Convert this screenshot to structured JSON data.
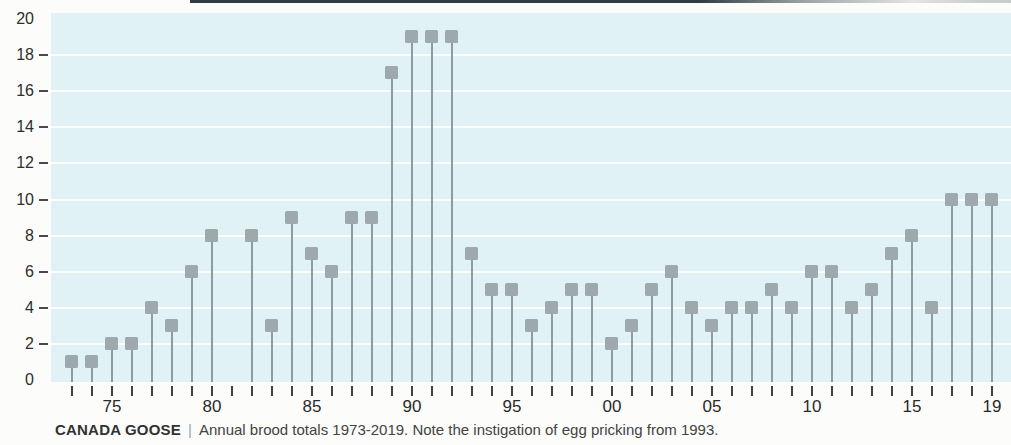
{
  "chart_data": {
    "type": "scatter",
    "variant": "lollipop-stem",
    "title": "CANADA GOOSE | Annual brood totals 1973-2019. Note the instigation of egg pricking from 1993.",
    "xlabel": "",
    "ylabel": "",
    "x": [
      1973,
      1974,
      1975,
      1976,
      1977,
      1978,
      1979,
      1980,
      1981,
      1982,
      1983,
      1984,
      1985,
      1986,
      1987,
      1988,
      1989,
      1990,
      1991,
      1992,
      1993,
      1994,
      1995,
      1996,
      1997,
      1998,
      1999,
      2000,
      2001,
      2002,
      2003,
      2004,
      2005,
      2006,
      2007,
      2008,
      2009,
      2010,
      2011,
      2012,
      2013,
      2014,
      2015,
      2016,
      2017,
      2018,
      2019
    ],
    "values": [
      1,
      1,
      2,
      2,
      4,
      3,
      6,
      8,
      0,
      8,
      3,
      9,
      7,
      6,
      9,
      9,
      17,
      19,
      19,
      19,
      7,
      5,
      5,
      3,
      4,
      5,
      5,
      2,
      3,
      5,
      6,
      4,
      3,
      4,
      4,
      5,
      4,
      6,
      6,
      4,
      5,
      7,
      8,
      4,
      10,
      10,
      10
    ],
    "ylim": [
      0,
      20
    ],
    "ytick_step": 2,
    "ytick_labels": [
      "0",
      "2",
      "4",
      "6",
      "8",
      "10",
      "12",
      "14",
      "16",
      "18",
      "20"
    ],
    "xticks": [
      {
        "year": 1975,
        "label": "75"
      },
      {
        "year": 1980,
        "label": "80"
      },
      {
        "year": 1985,
        "label": "85"
      },
      {
        "year": 1990,
        "label": "90"
      },
      {
        "year": 1995,
        "label": "95"
      },
      {
        "year": 2000,
        "label": "00"
      },
      {
        "year": 2005,
        "label": "05"
      },
      {
        "year": 2010,
        "label": "10"
      },
      {
        "year": 2015,
        "label": "15"
      },
      {
        "year": 2019,
        "label": "19"
      }
    ],
    "grid": "horizontal-white-lines-at-even-values-2-to-18",
    "legend": "none",
    "marker_shape": "square",
    "note": "1981 shows no stem or marker (value 0)"
  },
  "caption": {
    "species": "CANADA GOOSE",
    "separator": "|",
    "text": "Annual brood totals 1973-2019. Note the instigation of egg pricking from 1993."
  },
  "colors": {
    "plot_background": "#e0f2f6",
    "gridline": "#ffffff",
    "marker": "#9ea9ad",
    "stem": "#8d9ca3",
    "axis_text": "#2e2e2e",
    "tick": "#414141",
    "scan_edge": "#2d3c3e",
    "page_background": "#fcfcfa"
  }
}
